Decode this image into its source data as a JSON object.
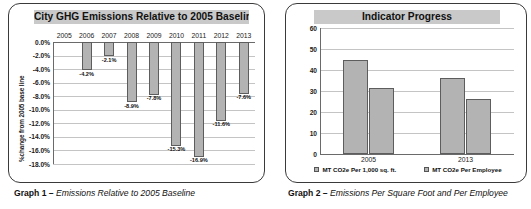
{
  "left_panel": {
    "caption_prefix": "Graph 1 –",
    "caption_text": "Emissions Relative to 2005 Baseline"
  },
  "right_panel": {
    "caption_prefix": "Graph 2 –",
    "caption_text": "Emissions Per Square Foot and Per Employee"
  },
  "chart_data": [
    {
      "type": "bar",
      "id": "graph-1",
      "title": "City GHG Emissions Relative to 2005 Baseline",
      "xlabel": "",
      "ylabel": "%change from 2005 base line",
      "ylim": [
        -18.0,
        0.0
      ],
      "ytick_labels": [
        "0.0%",
        "-2.0%",
        "-4.0%",
        "-6.0%",
        "-8.0%",
        "-10.0%",
        "-12.0%",
        "-14.0%",
        "-16.0%",
        "-18.0%"
      ],
      "ytick_values": [
        0,
        -2,
        -4,
        -6,
        -8,
        -10,
        -12,
        -14,
        -16,
        -18
      ],
      "grid": true,
      "legend": "none",
      "categories": [
        "2005",
        "2006",
        "2007",
        "2008",
        "2009",
        "2010",
        "2011",
        "2012",
        "2013"
      ],
      "values": [
        0,
        -4.2,
        -2.1,
        -8.9,
        -7.8,
        -15.3,
        -16.9,
        -11.6,
        -7.6
      ],
      "data_labels": [
        "",
        "-4.2%",
        "-2.1%",
        "-8.9%",
        "-7.8%",
        "-15.3%",
        "-16.9%",
        "-11.6%",
        "-7.6%"
      ],
      "bar_color": "#b3b3b3"
    },
    {
      "type": "bar",
      "id": "graph-2",
      "title": "Indicator Progress",
      "xlabel": "",
      "ylabel": "",
      "ylim": [
        0,
        60
      ],
      "ytick_labels": [
        "0",
        "10",
        "20",
        "30",
        "40",
        "50",
        "60"
      ],
      "ytick_values": [
        0,
        10,
        20,
        30,
        40,
        50,
        60
      ],
      "grid": true,
      "legend": "bottom",
      "categories": [
        "2005",
        "2013"
      ],
      "series": [
        {
          "name": "MT CO2e Per 1,000 sq. ft.",
          "values": [
            44.7,
            36.0
          ],
          "color": "#b3b3b3"
        },
        {
          "name": "MT CO2e Per Employee",
          "values": [
            31.3,
            26.3
          ],
          "color": "#b3b3b3"
        }
      ]
    }
  ]
}
